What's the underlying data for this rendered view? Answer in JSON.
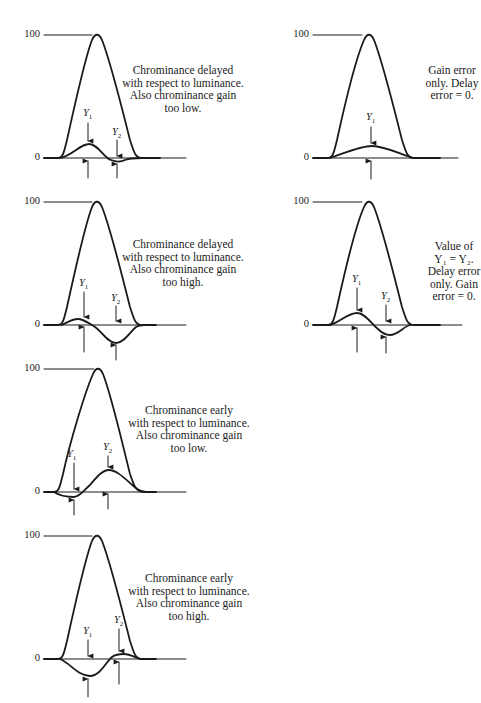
{
  "figure": {
    "panels": [
      {
        "id": "p1",
        "caption": "Chrominance delayed\nwith respect to luminance.\nAlso chrominance gain\ntoo low.",
        "tick_top": "100",
        "tick_zero": "0",
        "markers": [
          {
            "label": "Y",
            "sub": "1",
            "x": 88,
            "kind": "positive"
          },
          {
            "label": "Y",
            "sub": "2",
            "x": 117,
            "kind": "negative"
          }
        ]
      },
      {
        "id": "p2",
        "caption": "Gain error\nonly. Delay\nerror = 0.",
        "tick_top": "100",
        "tick_zero": "0",
        "markers": [
          {
            "label": "Y",
            "sub": "1",
            "x": 371,
            "kind": "positive"
          }
        ]
      },
      {
        "id": "p3",
        "caption": "Chrominance delayed\nwith respect to luminance.\nAlso chrominance gain\ntoo high.",
        "tick_top": "100",
        "tick_zero": "0",
        "markers": [
          {
            "label": "Y",
            "sub": "1",
            "x": 84,
            "kind": "positive"
          },
          {
            "label": "Y",
            "sub": "2",
            "x": 116,
            "kind": "negative"
          }
        ]
      },
      {
        "id": "p4",
        "caption": "Value of\nY₁ = Y₂.\nDelay error\nonly. Gain\nerror = 0.",
        "tick_top": "100",
        "tick_zero": "0",
        "markers": [
          {
            "label": "Y",
            "sub": "1",
            "x": 357,
            "kind": "positive"
          },
          {
            "label": "Y",
            "sub": "2",
            "x": 386,
            "kind": "negative"
          }
        ]
      },
      {
        "id": "p5",
        "caption": "Chrominance early\nwith respect to luminance.\nAlso chrominance gain\ntoo low.",
        "tick_top": "100",
        "tick_zero": "0",
        "markers": [
          {
            "label": "Y",
            "sub": "1",
            "x": 74,
            "kind": "negative"
          },
          {
            "label": "Y",
            "sub": "2",
            "x": 108,
            "kind": "positive"
          }
        ]
      },
      {
        "id": "p6",
        "caption": "Chrominance early\nwith respect to luminance.\nAlso chrominance gain\ntoo high.",
        "tick_top": "100",
        "tick_zero": "0",
        "markers": [
          {
            "label": "Y",
            "sub": "1",
            "x": 88,
            "kind": "negative"
          },
          {
            "label": "Y",
            "sub": "2",
            "x": 119,
            "kind": "positive"
          }
        ]
      }
    ]
  }
}
